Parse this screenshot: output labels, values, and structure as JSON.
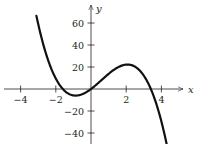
{
  "chart_data": {
    "type": "line",
    "title": "",
    "xlabel": "x",
    "ylabel": "y",
    "xlim": [
      -4.5,
      5
    ],
    "ylim": [
      -45,
      70
    ],
    "x_ticks": [
      -4,
      -2,
      2,
      4
    ],
    "x_tick_labels": [
      "−4",
      "−2",
      "2",
      "4"
    ],
    "y_ticks": [
      60,
      40,
      20,
      -20,
      -40
    ],
    "y_tick_labels": [
      "60",
      "40",
      "20",
      "−20",
      "−40"
    ],
    "grid": false,
    "legend": null,
    "series": [
      {
        "name": "cubic",
        "description": "Cubic curve with local min near (-0.9, -5) and local max near (2, 23), roots near -1.6, 0, 3.4",
        "x": [
          -3.1,
          -3.0,
          -2.5,
          -2.0,
          -1.6,
          -1.0,
          -0.85,
          -0.5,
          0,
          0.5,
          1.0,
          1.5,
          2.0,
          2.5,
          3.0,
          3.4,
          3.8,
          4.2,
          4.3
        ],
        "y": [
          66,
          60,
          37,
          19,
          0,
          -5.7,
          -6,
          -4.3,
          0,
          7.3,
          14.5,
          20.5,
          22.5,
          20,
          12.5,
          0,
          -18,
          -43,
          -50
        ]
      }
    ],
    "color": "#111111"
  }
}
